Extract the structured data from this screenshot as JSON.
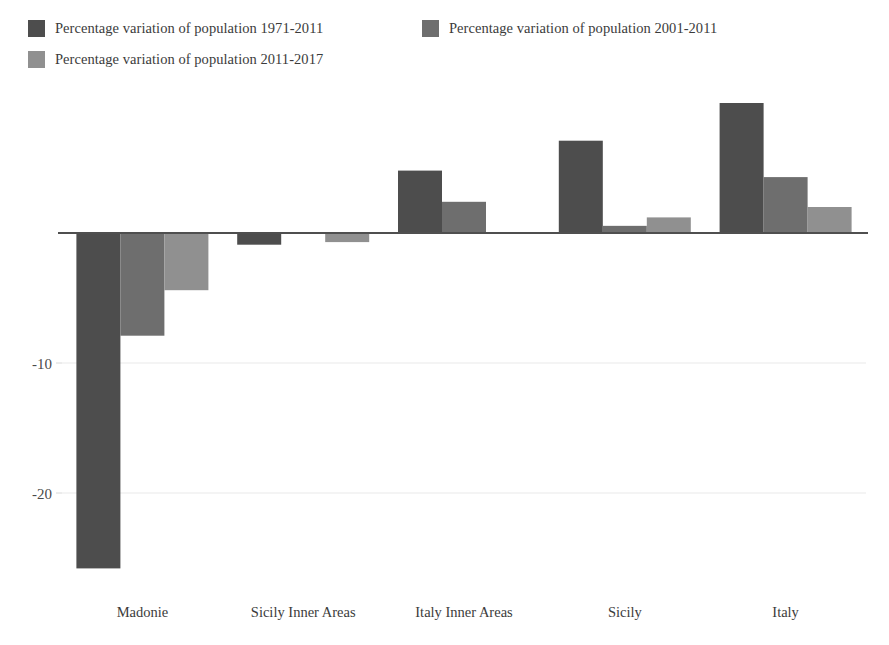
{
  "chart_data": {
    "type": "bar",
    "title": "",
    "xlabel": "",
    "ylabel": "",
    "categories": [
      "Madonie",
      "Sicily Inner Areas",
      "Italy Inner Areas",
      "Sicily",
      "Italy"
    ],
    "series": [
      {
        "name": "Percentage variation of population 1971-2011",
        "color": "#4d4d4d",
        "values": [
          -25.8,
          -0.9,
          4.8,
          7.1,
          10.0
        ]
      },
      {
        "name": "Percentage variation of population 2001-2011",
        "color": "#6e6e6e",
        "values": [
          -7.9,
          0.0,
          2.4,
          0.55,
          4.3
        ]
      },
      {
        "name": "Percentage variation of population 2011-2017",
        "color": "#909090",
        "values": [
          -4.4,
          -0.7,
          0.0,
          1.2,
          2.0
        ]
      }
    ],
    "ylim": [
      -28,
      12
    ],
    "yticks": [
      -10,
      -20
    ],
    "ytick_labels": [
      "-10",
      "-20"
    ],
    "grid": true,
    "legend_position": "top-left"
  },
  "legend": {
    "items": [
      {
        "label": "Percentage variation of population 1971-2011",
        "color": "#4d4d4d"
      },
      {
        "label": "Percentage variation of population 2001-2011",
        "color": "#6e6e6e"
      },
      {
        "label": "Percentage variation of population 2011-2017",
        "color": "#909090"
      }
    ]
  },
  "axis": {
    "y_tick_labels": [
      "-10",
      "-20"
    ],
    "x_tick_labels": [
      "Madonie",
      "Sicily Inner Areas",
      "Italy Inner Areas",
      "Sicily",
      "Italy"
    ]
  }
}
